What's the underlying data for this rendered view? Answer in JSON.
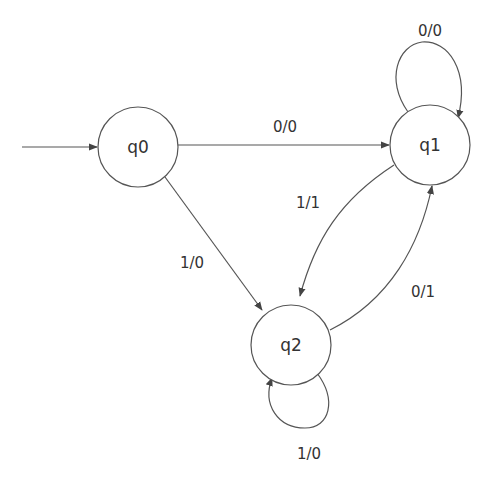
{
  "diagram": {
    "type": "finite-state-machine (Mealy)",
    "start_state": "q0",
    "states": [
      {
        "id": "q0",
        "label": "q0"
      },
      {
        "id": "q1",
        "label": "q1"
      },
      {
        "id": "q2",
        "label": "q2"
      }
    ],
    "transitions": [
      {
        "from": "q0",
        "to": "q1",
        "label": "0/0"
      },
      {
        "from": "q0",
        "to": "q2",
        "label": "1/0"
      },
      {
        "from": "q1",
        "to": "q1",
        "label": "0/0"
      },
      {
        "from": "q1",
        "to": "q2",
        "label": "1/1"
      },
      {
        "from": "q2",
        "to": "q1",
        "label": "0/1"
      },
      {
        "from": "q2",
        "to": "q2",
        "label": "1/0"
      }
    ],
    "colors": {
      "stroke": "#555555",
      "text": "#333333",
      "background": "#ffffff"
    }
  }
}
